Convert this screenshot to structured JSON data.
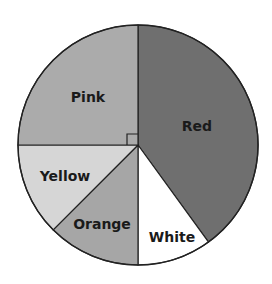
{
  "chart_data": {
    "type": "pie",
    "title": "",
    "start_angle_deg": 0,
    "direction": "clockwise",
    "categories": [
      "Red",
      "White",
      "Orange",
      "Yellow",
      "Pink"
    ],
    "values": [
      40,
      10,
      12.5,
      12.5,
      25
    ],
    "units": "percent (estimated from angles)",
    "angles_deg": [
      144,
      36,
      45,
      45,
      90
    ],
    "slices": [
      {
        "label": "Red",
        "value": 40,
        "color": "#6f6f6f",
        "label_pos": [
          197,
          127
        ]
      },
      {
        "label": "White",
        "value": 10,
        "color": "#ffffff",
        "label_pos": [
          172,
          238
        ]
      },
      {
        "label": "Orange",
        "value": 12.5,
        "color": "#a6a6a6",
        "label_pos": [
          102,
          225
        ]
      },
      {
        "label": "Yellow",
        "value": 12.5,
        "color": "#d6d6d6",
        "label_pos": [
          65,
          177
        ]
      },
      {
        "label": "Pink",
        "value": 25,
        "color": "#ababab",
        "label_pos": [
          88,
          98
        ]
      }
    ],
    "annotations": [
      "right-angle marker at center for Pink slice (90°)"
    ],
    "legend": "none (labels inside slices)"
  },
  "geometry": {
    "cx": 138,
    "cy": 145,
    "r": 120,
    "stroke": "#222222",
    "right_angle_marker_size": 11
  }
}
